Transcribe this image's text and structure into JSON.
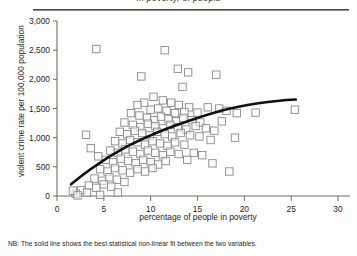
{
  "figure": {
    "clipped_title": "in poverty,                    of people",
    "note": "NB: The solid line shows the best statistical non-linear fit between the two variables."
  },
  "chart_data": {
    "type": "scatter",
    "title": "",
    "xlabel": "percentage of people in poverty",
    "ylabel": "violent crime rate per 100,000 population",
    "xlim": [
      0,
      30
    ],
    "ylim": [
      0,
      3000
    ],
    "xticks": [
      0,
      5,
      10,
      15,
      20,
      25,
      30
    ],
    "xtick_labels": [
      "0",
      "5",
      "10",
      "15",
      "20",
      "25",
      "30"
    ],
    "yticks": [
      0,
      500,
      1000,
      1500,
      2000,
      2500,
      3000
    ],
    "ytick_labels": [
      "0",
      "500",
      "1,000",
      "1,500",
      "2,000",
      "2,500",
      "3,000"
    ],
    "grid": false,
    "legend": "none",
    "marker": "open-square",
    "marker_color": "#8a8a8a",
    "points": [
      [
        4.2,
        2520
      ],
      [
        11.5,
        2500
      ],
      [
        9.0,
        2050
      ],
      [
        13.4,
        1870
      ],
      [
        17.0,
        2080
      ],
      [
        10.3,
        1700
      ],
      [
        11.3,
        1640
      ],
      [
        12.2,
        1600
      ],
      [
        13.0,
        1560
      ],
      [
        14.1,
        1520
      ],
      [
        9.3,
        1600
      ],
      [
        8.6,
        1560
      ],
      [
        10.0,
        1480
      ],
      [
        10.8,
        1500
      ],
      [
        11.7,
        1460
      ],
      [
        12.6,
        1420
      ],
      [
        13.6,
        1440
      ],
      [
        15.0,
        1430
      ],
      [
        16.1,
        1520
      ],
      [
        17.3,
        1500
      ],
      [
        7.9,
        1420
      ],
      [
        8.8,
        1380
      ],
      [
        9.6,
        1340
      ],
      [
        10.4,
        1300
      ],
      [
        11.1,
        1360
      ],
      [
        11.9,
        1320
      ],
      [
        12.7,
        1280
      ],
      [
        13.5,
        1340
      ],
      [
        14.4,
        1300
      ],
      [
        15.3,
        1260
      ],
      [
        7.2,
        1260
      ],
      [
        8.1,
        1220
      ],
      [
        8.9,
        1180
      ],
      [
        9.7,
        1240
      ],
      [
        10.5,
        1200
      ],
      [
        11.3,
        1160
      ],
      [
        12.1,
        1220
      ],
      [
        12.9,
        1180
      ],
      [
        13.8,
        1140
      ],
      [
        14.8,
        1200
      ],
      [
        6.7,
        1100
      ],
      [
        7.5,
        1060
      ],
      [
        8.3,
        1120
      ],
      [
        9.1,
        1080
      ],
      [
        9.9,
        1040
      ],
      [
        10.7,
        1100
      ],
      [
        11.5,
        1060
      ],
      [
        12.3,
        1020
      ],
      [
        13.2,
        1080
      ],
      [
        14.2,
        1040
      ],
      [
        6.2,
        940
      ],
      [
        7.0,
        900
      ],
      [
        7.8,
        960
      ],
      [
        8.6,
        920
      ],
      [
        9.4,
        880
      ],
      [
        10.2,
        940
      ],
      [
        11.0,
        900
      ],
      [
        11.8,
        860
      ],
      [
        12.6,
        920
      ],
      [
        13.6,
        880
      ],
      [
        5.7,
        780
      ],
      [
        6.5,
        740
      ],
      [
        7.3,
        800
      ],
      [
        8.1,
        760
      ],
      [
        8.9,
        720
      ],
      [
        9.7,
        780
      ],
      [
        10.5,
        740
      ],
      [
        11.3,
        700
      ],
      [
        12.1,
        760
      ],
      [
        13.0,
        720
      ],
      [
        5.2,
        620
      ],
      [
        6.0,
        580
      ],
      [
        6.8,
        640
      ],
      [
        7.6,
        600
      ],
      [
        8.4,
        560
      ],
      [
        9.2,
        620
      ],
      [
        10.0,
        580
      ],
      [
        10.8,
        540
      ],
      [
        11.6,
        600
      ],
      [
        4.6,
        460
      ],
      [
        5.4,
        420
      ],
      [
        6.2,
        480
      ],
      [
        7.0,
        440
      ],
      [
        7.8,
        400
      ],
      [
        8.6,
        460
      ],
      [
        9.4,
        420
      ],
      [
        10.2,
        480
      ],
      [
        4.0,
        300
      ],
      [
        4.8,
        260
      ],
      [
        5.6,
        320
      ],
      [
        6.4,
        280
      ],
      [
        7.2,
        240
      ],
      [
        3.4,
        180
      ],
      [
        4.2,
        140
      ],
      [
        5.0,
        200
      ],
      [
        5.8,
        160
      ],
      [
        2.6,
        100
      ],
      [
        3.2,
        60
      ],
      [
        2.0,
        40
      ],
      [
        1.7,
        90
      ],
      [
        6.5,
        60
      ],
      [
        4.6,
        20
      ],
      [
        2.2,
        10
      ],
      [
        3.1,
        1050
      ],
      [
        4.4,
        680
      ],
      [
        3.6,
        820
      ],
      [
        15.9,
        1160
      ],
      [
        16.8,
        1120
      ],
      [
        15.2,
        1020
      ],
      [
        16.4,
        960
      ],
      [
        14.6,
        740
      ],
      [
        15.5,
        700
      ],
      [
        13.9,
        620
      ],
      [
        18.1,
        1460
      ],
      [
        19.2,
        1420
      ],
      [
        17.6,
        1280
      ],
      [
        19.0,
        1000
      ],
      [
        21.2,
        1430
      ],
      [
        25.4,
        1480
      ],
      [
        16.6,
        560
      ],
      [
        18.4,
        420
      ],
      [
        12.9,
        2180
      ],
      [
        14.0,
        2120
      ]
    ],
    "fit_line": {
      "label": "best statistical non-linear fit",
      "color": "#111111",
      "width": 2.6,
      "points": [
        [
          1.5,
          200
        ],
        [
          2.5,
          330
        ],
        [
          3.5,
          450
        ],
        [
          4.5,
          560
        ],
        [
          5.5,
          665
        ],
        [
          6.5,
          760
        ],
        [
          7.5,
          850
        ],
        [
          8.5,
          930
        ],
        [
          9.5,
          1005
        ],
        [
          10.5,
          1075
        ],
        [
          11.5,
          1140
        ],
        [
          12.5,
          1200
        ],
        [
          13.5,
          1255
        ],
        [
          14.5,
          1310
        ],
        [
          15.5,
          1365
        ],
        [
          16.5,
          1415
        ],
        [
          17.5,
          1460
        ],
        [
          18.5,
          1500
        ],
        [
          19.5,
          1535
        ],
        [
          20.5,
          1565
        ],
        [
          21.5,
          1590
        ],
        [
          22.5,
          1612
        ],
        [
          23.5,
          1630
        ],
        [
          24.5,
          1645
        ],
        [
          25.5,
          1655
        ]
      ]
    }
  }
}
